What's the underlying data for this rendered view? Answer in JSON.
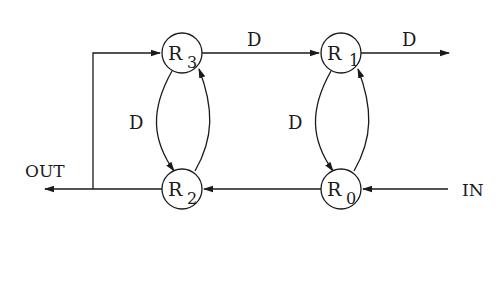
{
  "diagram": {
    "nodes": [
      {
        "id": "R3",
        "base": "R",
        "sub": "3",
        "cx": 182,
        "cy": 53
      },
      {
        "id": "R1",
        "base": "R",
        "sub": "1",
        "cx": 341,
        "cy": 53
      },
      {
        "id": "R2",
        "base": "R",
        "sub": "2",
        "cx": 182,
        "cy": 189
      },
      {
        "id": "R0",
        "base": "R",
        "sub": "0",
        "cx": 341,
        "cy": 189
      }
    ],
    "edge_labels": {
      "r3_to_r1": "D",
      "r1_out": "D",
      "r3_r2_loop": "D",
      "r1_r0_loop": "D"
    },
    "io_labels": {
      "out": "OUT",
      "in": "IN"
    },
    "colors": {
      "stroke": "#1a1a1a",
      "background": "#ffffff"
    }
  }
}
